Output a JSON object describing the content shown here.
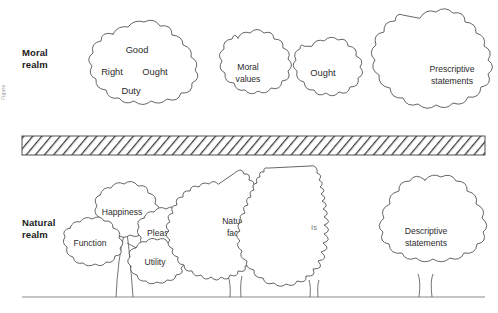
{
  "figure": {
    "edge_caption": "Figure",
    "background": "#ffffff",
    "ink_color": "#4a4a4a",
    "text_color": "#2b2b2b"
  },
  "realms": [
    {
      "id": "moral",
      "label": "Moral\nrealm"
    },
    {
      "id": "natural",
      "label": "Natural\nrealm"
    }
  ],
  "divider": {
    "name": "hatched-barrier",
    "hatch_color": "#3d3d3d",
    "x": 22,
    "y": 136,
    "width": 463,
    "height": 19
  },
  "ground": {
    "name": "ground-line",
    "x1": 22,
    "y1": 297,
    "x2": 485,
    "y2": 297
  },
  "moral_clouds": [
    {
      "id": "cloud-virtues",
      "labels": [
        "Good",
        "Right",
        "Ought",
        "Duty"
      ]
    },
    {
      "id": "cloud-moral-values",
      "labels": [
        "Moral",
        "values"
      ]
    },
    {
      "id": "cloud-ought",
      "labels": [
        "Ought"
      ]
    },
    {
      "id": "cloud-prescriptive-statements",
      "labels": [
        "Prescriptive",
        "statements"
      ]
    }
  ],
  "natural_trees": [
    {
      "id": "tree-multi-canopy",
      "labels": [
        "Happiness",
        "Pleasure",
        "Function",
        "Utility"
      ]
    },
    {
      "id": "tree-natural-facts",
      "labels": [
        "Natural",
        "facts"
      ]
    },
    {
      "id": "tree-is",
      "labels": [
        "Is"
      ]
    },
    {
      "id": "tree-descriptive-statements",
      "labels": [
        "Descriptive",
        "statements"
      ]
    }
  ]
}
